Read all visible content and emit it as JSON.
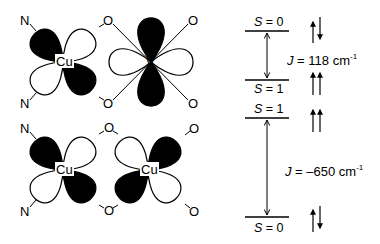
{
  "diagram": {
    "left_panel": {
      "top_complex": {
        "metal_1": "Cu",
        "metal_2": "V",
        "ligands_left": [
          "N",
          "N"
        ],
        "bridging_oxygens": [
          "O",
          "O"
        ],
        "terminal_oxygens_right": [
          "O",
          "O"
        ]
      },
      "bottom_complex": {
        "metal_1": "Cu",
        "metal_2": "Cu",
        "ligands_left": [
          "N",
          "N"
        ],
        "bridging_oxygens": [
          "O",
          "O"
        ],
        "terminal_oxygens_right": [
          "O",
          "O"
        ]
      }
    },
    "right_panel": {
      "top_diagram": {
        "upper_state": {
          "label_var": "S",
          "label_value": " = 0",
          "spins": "up-down"
        },
        "lower_state": {
          "label_var": "S",
          "label_value": " = 1",
          "spins": "up-up"
        },
        "coupling": {
          "var": "J",
          "text": " = 118 cm",
          "exp": "-1"
        }
      },
      "bottom_diagram": {
        "upper_state": {
          "label_var": "S",
          "label_value": " = 1",
          "spins": "up-up"
        },
        "lower_state": {
          "label_var": "S",
          "label_value": " = 0",
          "spins": "up-down"
        },
        "coupling": {
          "var": "J",
          "text": " = –650 cm",
          "exp": "-1"
        }
      }
    },
    "colors": {
      "ink": "#000000",
      "background": "#ffffff"
    }
  }
}
